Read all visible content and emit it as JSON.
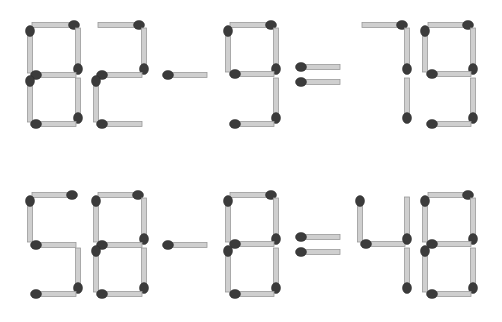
{
  "puzzle": {
    "equations": [
      {
        "text": "82-9=79",
        "symbols": [
          {
            "char": "8",
            "sticks": [
              {
                "x1": 32,
                "y1": 25,
                "x2": 74,
                "y2": 25,
                "head": "end"
              },
              {
                "x1": 30,
                "y1": 31,
                "x2": 30,
                "y2": 73,
                "head": "start"
              },
              {
                "x1": 78,
                "y1": 28,
                "x2": 78,
                "y2": 69,
                "head": "end"
              },
              {
                "x1": 36,
                "y1": 75,
                "x2": 76,
                "y2": 75,
                "head": "start"
              },
              {
                "x1": 30,
                "y1": 81,
                "x2": 30,
                "y2": 122,
                "head": "start"
              },
              {
                "x1": 78,
                "y1": 78,
                "x2": 78,
                "y2": 118,
                "head": "end"
              },
              {
                "x1": 36,
                "y1": 124,
                "x2": 76,
                "y2": 124,
                "head": "start"
              }
            ]
          },
          {
            "char": "2",
            "sticks": [
              {
                "x1": 98,
                "y1": 25,
                "x2": 139,
                "y2": 25,
                "head": "end"
              },
              {
                "x1": 144,
                "y1": 28,
                "x2": 144,
                "y2": 69,
                "head": "end"
              },
              {
                "x1": 102,
                "y1": 75,
                "x2": 142,
                "y2": 75,
                "head": "start"
              },
              {
                "x1": 96,
                "y1": 81,
                "x2": 96,
                "y2": 122,
                "head": "start"
              },
              {
                "x1": 102,
                "y1": 124,
                "x2": 142,
                "y2": 124,
                "head": "start"
              }
            ]
          },
          {
            "char": "-",
            "sticks": [
              {
                "x1": 168,
                "y1": 75,
                "x2": 207,
                "y2": 75,
                "head": "start"
              }
            ]
          },
          {
            "char": "9",
            "sticks": [
              {
                "x1": 230,
                "y1": 25,
                "x2": 271,
                "y2": 25,
                "head": "end"
              },
              {
                "x1": 228,
                "y1": 31,
                "x2": 228,
                "y2": 72,
                "head": "start"
              },
              {
                "x1": 276,
                "y1": 28,
                "x2": 276,
                "y2": 69,
                "head": "end"
              },
              {
                "x1": 235,
                "y1": 74,
                "x2": 274,
                "y2": 74,
                "head": "start"
              },
              {
                "x1": 276,
                "y1": 78,
                "x2": 276,
                "y2": 118,
                "head": "end"
              },
              {
                "x1": 235,
                "y1": 124,
                "x2": 274,
                "y2": 124,
                "head": "start"
              }
            ]
          },
          {
            "char": "=",
            "sticks": [
              {
                "x1": 301,
                "y1": 67,
                "x2": 340,
                "y2": 67,
                "head": "start"
              },
              {
                "x1": 301,
                "y1": 82,
                "x2": 340,
                "y2": 82,
                "head": "start"
              }
            ]
          },
          {
            "char": "7",
            "sticks": [
              {
                "x1": 362,
                "y1": 25,
                "x2": 402,
                "y2": 25,
                "head": "end"
              },
              {
                "x1": 407,
                "y1": 28,
                "x2": 407,
                "y2": 69,
                "head": "end"
              },
              {
                "x1": 407,
                "y1": 78,
                "x2": 407,
                "y2": 118,
                "head": "end"
              }
            ]
          },
          {
            "char": "9",
            "sticks": [
              {
                "x1": 428,
                "y1": 25,
                "x2": 468,
                "y2": 25,
                "head": "end"
              },
              {
                "x1": 425,
                "y1": 31,
                "x2": 425,
                "y2": 72,
                "head": "start"
              },
              {
                "x1": 473,
                "y1": 28,
                "x2": 473,
                "y2": 69,
                "head": "end"
              },
              {
                "x1": 432,
                "y1": 74,
                "x2": 471,
                "y2": 74,
                "head": "start"
              },
              {
                "x1": 473,
                "y1": 78,
                "x2": 473,
                "y2": 118,
                "head": "end"
              },
              {
                "x1": 432,
                "y1": 124,
                "x2": 471,
                "y2": 124,
                "head": "start"
              }
            ]
          }
        ]
      },
      {
        "text": "58-8=48",
        "symbols": [
          {
            "char": "5",
            "sticks": [
              {
                "x1": 32,
                "y1": 195,
                "x2": 72,
                "y2": 195,
                "head": "end"
              },
              {
                "x1": 30,
                "y1": 201,
                "x2": 30,
                "y2": 242,
                "head": "start"
              },
              {
                "x1": 36,
                "y1": 245,
                "x2": 76,
                "y2": 245,
                "head": "start"
              },
              {
                "x1": 78,
                "y1": 248,
                "x2": 78,
                "y2": 288,
                "head": "end"
              },
              {
                "x1": 36,
                "y1": 294,
                "x2": 76,
                "y2": 294,
                "head": "start"
              }
            ]
          },
          {
            "char": "8",
            "sticks": [
              {
                "x1": 98,
                "y1": 195,
                "x2": 138,
                "y2": 195,
                "head": "end"
              },
              {
                "x1": 96,
                "y1": 201,
                "x2": 96,
                "y2": 242,
                "head": "start"
              },
              {
                "x1": 144,
                "y1": 198,
                "x2": 144,
                "y2": 239,
                "head": "end"
              },
              {
                "x1": 102,
                "y1": 245,
                "x2": 142,
                "y2": 245,
                "head": "start"
              },
              {
                "x1": 96,
                "y1": 251,
                "x2": 96,
                "y2": 292,
                "head": "start"
              },
              {
                "x1": 144,
                "y1": 248,
                "x2": 144,
                "y2": 288,
                "head": "end"
              },
              {
                "x1": 102,
                "y1": 294,
                "x2": 142,
                "y2": 294,
                "head": "start"
              }
            ]
          },
          {
            "char": "-",
            "sticks": [
              {
                "x1": 168,
                "y1": 245,
                "x2": 207,
                "y2": 245,
                "head": "start"
              }
            ]
          },
          {
            "char": "8",
            "sticks": [
              {
                "x1": 230,
                "y1": 195,
                "x2": 271,
                "y2": 195,
                "head": "end"
              },
              {
                "x1": 228,
                "y1": 201,
                "x2": 228,
                "y2": 242,
                "head": "start"
              },
              {
                "x1": 276,
                "y1": 198,
                "x2": 276,
                "y2": 239,
                "head": "end"
              },
              {
                "x1": 235,
                "y1": 244,
                "x2": 274,
                "y2": 244,
                "head": "start"
              },
              {
                "x1": 228,
                "y1": 251,
                "x2": 228,
                "y2": 292,
                "head": "start"
              },
              {
                "x1": 276,
                "y1": 248,
                "x2": 276,
                "y2": 288,
                "head": "end"
              },
              {
                "x1": 235,
                "y1": 294,
                "x2": 274,
                "y2": 294,
                "head": "start"
              }
            ]
          },
          {
            "char": "=",
            "sticks": [
              {
                "x1": 301,
                "y1": 237,
                "x2": 340,
                "y2": 237,
                "head": "start"
              },
              {
                "x1": 301,
                "y1": 252,
                "x2": 340,
                "y2": 252,
                "head": "start"
              }
            ]
          },
          {
            "char": "4",
            "sticks": [
              {
                "x1": 360,
                "y1": 201,
                "x2": 360,
                "y2": 242,
                "head": "start"
              },
              {
                "x1": 366,
                "y1": 244,
                "x2": 405,
                "y2": 244,
                "head": "start"
              },
              {
                "x1": 407,
                "y1": 197,
                "x2": 407,
                "y2": 239,
                "head": "end"
              },
              {
                "x1": 407,
                "y1": 248,
                "x2": 407,
                "y2": 288,
                "head": "end"
              }
            ]
          },
          {
            "char": "8",
            "sticks": [
              {
                "x1": 428,
                "y1": 195,
                "x2": 468,
                "y2": 195,
                "head": "end"
              },
              {
                "x1": 425,
                "y1": 201,
                "x2": 425,
                "y2": 242,
                "head": "start"
              },
              {
                "x1": 473,
                "y1": 198,
                "x2": 473,
                "y2": 239,
                "head": "end"
              },
              {
                "x1": 432,
                "y1": 244,
                "x2": 471,
                "y2": 244,
                "head": "start"
              },
              {
                "x1": 425,
                "y1": 251,
                "x2": 425,
                "y2": 292,
                "head": "start"
              },
              {
                "x1": 473,
                "y1": 248,
                "x2": 473,
                "y2": 288,
                "head": "end"
              },
              {
                "x1": 432,
                "y1": 294,
                "x2": 471,
                "y2": 294,
                "head": "start"
              }
            ]
          }
        ]
      }
    ]
  },
  "colors": {
    "background": "#ffffff",
    "stick": "#cfcfcf",
    "stick_edge": "#9a9a9a",
    "head": "#3b3b3b"
  }
}
